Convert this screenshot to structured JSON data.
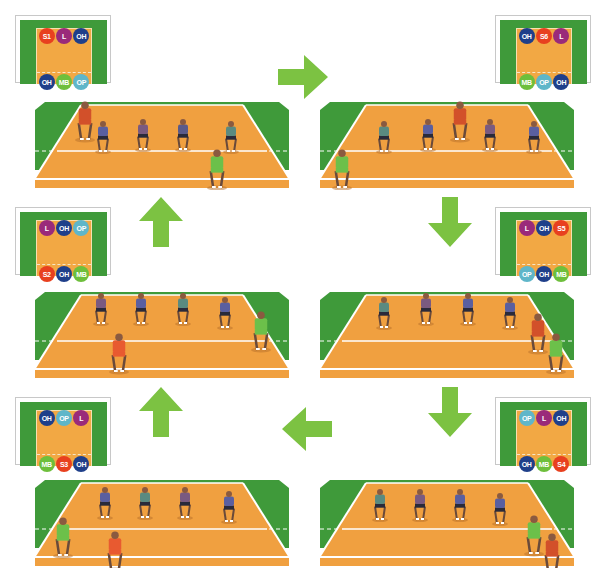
{
  "diagram": {
    "type": "volleyball-rotation",
    "colors": {
      "setter": "#e8401f",
      "libero": "#9a2a7a",
      "outside_hitter": "#1f3f8a",
      "middle_blocker": "#6ebf3c",
      "opposite": "#5fb6c9",
      "arrow": "#7cc242",
      "court_orange": "#f0a040",
      "court_green": "#3f9a3a"
    },
    "flow": [
      "S1",
      "S6",
      "S5",
      "S4",
      "S3",
      "S2"
    ],
    "rotations": [
      {
        "id": "S1",
        "front_row": [
          {
            "label": "S1",
            "role": "setter"
          },
          {
            "label": "L",
            "role": "libero"
          },
          {
            "label": "OH",
            "role": "outside_hitter"
          }
        ],
        "back_row": [
          {
            "label": "OH",
            "role": "outside_hitter"
          },
          {
            "label": "MB",
            "role": "middle_blocker"
          },
          {
            "label": "OP",
            "role": "opposite"
          }
        ]
      },
      {
        "id": "S6",
        "front_row": [
          {
            "label": "OH",
            "role": "outside_hitter"
          },
          {
            "label": "S6",
            "role": "setter"
          },
          {
            "label": "L",
            "role": "libero"
          }
        ],
        "back_row": [
          {
            "label": "MB",
            "role": "middle_blocker"
          },
          {
            "label": "OP",
            "role": "opposite"
          },
          {
            "label": "OH",
            "role": "outside_hitter"
          }
        ]
      },
      {
        "id": "S2",
        "front_row": [
          {
            "label": "L",
            "role": "libero"
          },
          {
            "label": "OH",
            "role": "outside_hitter"
          },
          {
            "label": "OP",
            "role": "opposite"
          }
        ],
        "back_row": [
          {
            "label": "S2",
            "role": "setter"
          },
          {
            "label": "OH",
            "role": "outside_hitter"
          },
          {
            "label": "MB",
            "role": "middle_blocker"
          }
        ]
      },
      {
        "id": "S5",
        "front_row": [
          {
            "label": "L",
            "role": "libero"
          },
          {
            "label": "OH",
            "role": "outside_hitter"
          },
          {
            "label": "S5",
            "role": "setter"
          }
        ],
        "back_row": [
          {
            "label": "OP",
            "role": "opposite"
          },
          {
            "label": "OH",
            "role": "outside_hitter"
          },
          {
            "label": "MB",
            "role": "middle_blocker"
          }
        ]
      },
      {
        "id": "S3",
        "front_row": [
          {
            "label": "OH",
            "role": "outside_hitter"
          },
          {
            "label": "OP",
            "role": "opposite"
          },
          {
            "label": "L",
            "role": "libero"
          }
        ],
        "back_row": [
          {
            "label": "MB",
            "role": "middle_blocker"
          },
          {
            "label": "S3",
            "role": "setter"
          },
          {
            "label": "OH",
            "role": "outside_hitter"
          }
        ]
      },
      {
        "id": "S4",
        "front_row": [
          {
            "label": "OP",
            "role": "opposite"
          },
          {
            "label": "L",
            "role": "libero"
          },
          {
            "label": "OH",
            "role": "outside_hitter"
          }
        ],
        "back_row": [
          {
            "label": "OH",
            "role": "outside_hitter"
          },
          {
            "label": "MB",
            "role": "middle_blocker"
          },
          {
            "label": "S4",
            "role": "setter"
          }
        ]
      }
    ],
    "arrows": [
      {
        "from": "S1",
        "to": "S6",
        "direction": "right"
      },
      {
        "from": "S6",
        "to": "S5",
        "direction": "down"
      },
      {
        "from": "S5",
        "to": "S4",
        "direction": "down"
      },
      {
        "from": "S4",
        "to": "S3",
        "direction": "left"
      },
      {
        "from": "S3",
        "to": "S2",
        "direction": "up"
      },
      {
        "from": "S2",
        "to": "S1",
        "direction": "up"
      }
    ]
  }
}
